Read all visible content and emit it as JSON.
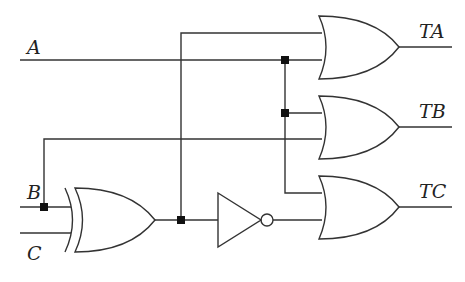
{
  "diagram": {
    "type": "logic-circuit",
    "colors": {
      "wire": "#333333",
      "background": "#ffffff",
      "junction": "#111111"
    },
    "inputs": [
      {
        "id": "A",
        "label": "A"
      },
      {
        "id": "B",
        "label": "B"
      },
      {
        "id": "C",
        "label": "C"
      }
    ],
    "outputs": [
      {
        "id": "TA",
        "label": "TA"
      },
      {
        "id": "TB",
        "label": "TB"
      },
      {
        "id": "TC",
        "label": "TC"
      }
    ],
    "gates": [
      {
        "id": "xor1",
        "type": "XOR",
        "inputs": [
          "B",
          "C"
        ],
        "output": "n1"
      },
      {
        "id": "not1",
        "type": "NOT",
        "inputs": [
          "n1"
        ],
        "output": "n2"
      },
      {
        "id": "orA",
        "type": "OR",
        "inputs": [
          "n1",
          "A"
        ],
        "output": "TA"
      },
      {
        "id": "orB",
        "type": "OR",
        "inputs": [
          "A",
          "B"
        ],
        "output": "TB"
      },
      {
        "id": "orC",
        "type": "OR",
        "inputs": [
          "A",
          "n2"
        ],
        "output": "TC"
      }
    ],
    "junctions": 5
  }
}
